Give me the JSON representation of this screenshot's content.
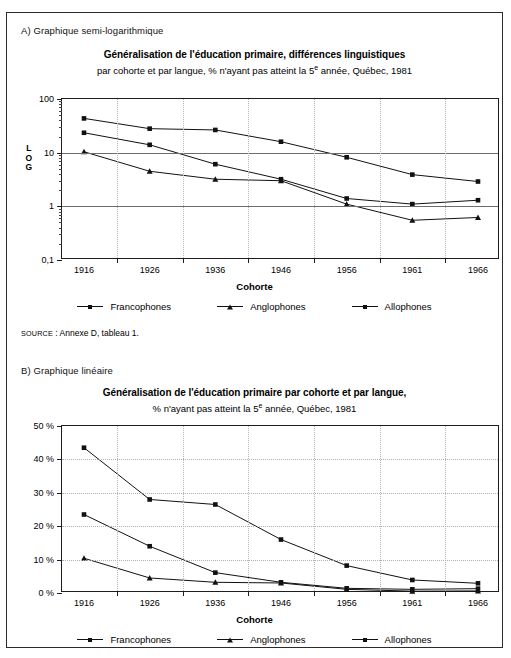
{
  "panelA": {
    "label": "A) Graphique semi-logarithmique",
    "title": "Généralisation de l'éducation primaire, différences linguistiques",
    "subtitle_pre": "par cohorte et par langue, % n'ayant pas atteint la 5",
    "subtitle_sup": "e",
    "subtitle_post": " année, Québec, 1981",
    "ylabel_letters": [
      "L",
      "O",
      "G"
    ],
    "xlabel": "Cohorte",
    "source_caps": "Source",
    "source_text": " : Annexe D, tableau 1."
  },
  "panelB": {
    "label": "B) Graphique linéaire",
    "title": "Généralisation de l'éducation primaire par cohorte et par langue,",
    "subtitle_pre": "% n'ayant pas atteint la 5",
    "subtitle_sup": "e",
    "subtitle_post": " année, Québec, 1981",
    "xlabel": "Cohorte",
    "source_caps": "Source",
    "source_text": " : Annexe D, tableau 1."
  },
  "legend": {
    "items": [
      {
        "label": "Francophones",
        "marker": "square"
      },
      {
        "label": "Anglophones",
        "marker": "triangle"
      },
      {
        "label": "Allophones",
        "marker": "square"
      }
    ]
  },
  "chart_data": [
    {
      "type": "line",
      "id": "panel-a-semilog",
      "title": "Généralisation de l'éducation primaire, différences linguistiques",
      "subtitle": "par cohorte et par langue, % n'ayant pas atteint la 5e année, Québec, 1981",
      "xlabel": "Cohorte",
      "ylabel": "LOG",
      "yscale": "log",
      "ylim": [
        0.1,
        100
      ],
      "ytick_labels": [
        "100",
        "10",
        "1",
        "0,1"
      ],
      "ytick_values": [
        100,
        10,
        1,
        0.1
      ],
      "grid": "major-horizontal-solid, vertical-dotted",
      "legend_position": "below",
      "categories": [
        "1916",
        "1926",
        "1936",
        "1946",
        "1956",
        "1961",
        "1966"
      ],
      "series": [
        {
          "name": "Francophones",
          "marker": "square",
          "values": [
            23.5,
            14.0,
            6.1,
            3.2,
            1.4,
            1.1,
            1.3
          ]
        },
        {
          "name": "Anglophones",
          "marker": "triangle",
          "values": [
            10.4,
            4.5,
            3.2,
            3.0,
            1.1,
            0.55,
            0.62
          ]
        },
        {
          "name": "Allophones",
          "marker": "square",
          "values": [
            43.5,
            28.0,
            26.5,
            16.0,
            8.2,
            3.9,
            2.9
          ]
        }
      ]
    },
    {
      "type": "line",
      "id": "panel-b-linear",
      "title": "Généralisation de l'éducation primaire par cohorte et par langue,",
      "subtitle": "% n'ayant pas atteint la 5e année, Québec, 1981",
      "xlabel": "Cohorte",
      "ylabel": "",
      "yscale": "linear",
      "ylim": [
        0,
        50
      ],
      "ytick_labels": [
        "50 %",
        "40 %",
        "30 %",
        "20 %",
        "10 %",
        "0 %"
      ],
      "ytick_values": [
        50,
        40,
        30,
        20,
        10,
        0
      ],
      "grid": "dotted",
      "legend_position": "below",
      "categories": [
        "1916",
        "1926",
        "1936",
        "1946",
        "1956",
        "1961",
        "1966"
      ],
      "series": [
        {
          "name": "Francophones",
          "marker": "square",
          "values": [
            23.5,
            14.0,
            6.1,
            3.2,
            1.4,
            1.1,
            1.3
          ]
        },
        {
          "name": "Anglophones",
          "marker": "triangle",
          "values": [
            10.4,
            4.5,
            3.2,
            3.0,
            1.1,
            0.55,
            0.62
          ]
        },
        {
          "name": "Allophones",
          "marker": "square",
          "values": [
            43.5,
            28.0,
            26.5,
            16.0,
            8.2,
            3.9,
            2.9
          ]
        }
      ]
    }
  ]
}
